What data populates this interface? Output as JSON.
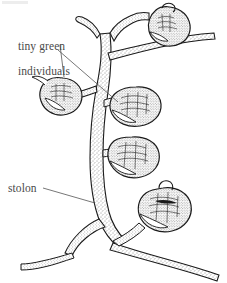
{
  "figure": {
    "kind": "scientific-line-drawing",
    "background_color": "#ffffff",
    "ink_color": "#1a1a1a",
    "label_color": "#4a4a4a",
    "width": 227,
    "height": 283
  },
  "labels": {
    "tiny_green": {
      "line1": "tiny green",
      "line2": "individuals",
      "leader_count": 2
    },
    "stolon": {
      "text": "stolon",
      "leader_count": 1
    }
  },
  "parts": {
    "stolon_label": "stolon",
    "individual_label": "tiny green individuals",
    "zooid_count": 5,
    "zooids": [
      {
        "name": "zooid-top-right",
        "cx": 172,
        "cy": 22
      },
      {
        "name": "zooid-left",
        "cx": 66,
        "cy": 95
      },
      {
        "name": "zooid-middle-upper",
        "cx": 137,
        "cy": 104
      },
      {
        "name": "zooid-middle-lower",
        "cx": 135,
        "cy": 155
      },
      {
        "name": "zooid-bottom-right",
        "cx": 165,
        "cy": 209
      }
    ]
  }
}
